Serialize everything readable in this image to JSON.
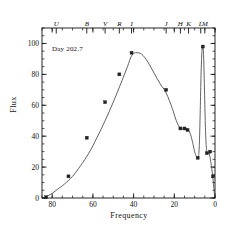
{
  "figure": {
    "annotation": "Day 202.7",
    "axis_color": "#111111",
    "curve_color": "#444444",
    "marker_color": "#222222"
  },
  "chart_data": {
    "type": "line",
    "title": "",
    "subtitle": "",
    "annotation": "Day 202.7",
    "xlabel": "Frequency",
    "ylabel": "Flux",
    "xlim": [
      85,
      0
    ],
    "ylim": [
      0,
      110
    ],
    "x_reversed": true,
    "grid": false,
    "legend": null,
    "xticks": [
      80,
      60,
      40,
      20,
      0
    ],
    "xtick_labels": [
      "80",
      "60",
      "40",
      "20",
      "0"
    ],
    "x_minor_tick_step": 5,
    "yticks": [
      0,
      20,
      40,
      60,
      80,
      100
    ],
    "ytick_labels": [
      "0",
      "20",
      "40",
      "60",
      "80",
      "100"
    ],
    "y_minor_tick_step": 5,
    "top_axis": {
      "label": "photometric bands",
      "bands": [
        {
          "name": "U",
          "x": 78
        },
        {
          "name": "B",
          "x": 63
        },
        {
          "name": "V",
          "x": 54
        },
        {
          "name": "R",
          "x": 47
        },
        {
          "name": "I",
          "x": 41
        },
        {
          "name": "J",
          "x": 24
        },
        {
          "name": "H",
          "x": 17
        },
        {
          "name": "K",
          "x": 13
        },
        {
          "name": "L",
          "x": 7
        },
        {
          "name": "M",
          "x": 5
        }
      ]
    },
    "series": [
      {
        "name": "model curve",
        "style": "solid",
        "x": [
          83.5,
          82,
          80,
          77,
          74,
          70,
          66,
          62,
          58,
          54,
          50,
          46,
          43,
          41,
          39,
          36,
          33,
          30,
          27,
          24,
          21,
          19,
          17,
          15,
          14,
          13,
          12,
          11,
          10,
          9.2,
          8.5,
          8.0,
          7.6,
          7.2,
          6.8,
          6.4,
          6.0,
          5.6,
          5.2,
          4.8,
          4.4,
          4.0,
          3.5,
          3.0,
          2.4,
          1.8,
          1.2,
          0.6,
          0.2
        ],
        "y": [
          0.5,
          1.5,
          3,
          6,
          9,
          14,
          21,
          29,
          39,
          50,
          62,
          75,
          85,
          92,
          94,
          93,
          88,
          81,
          74,
          68,
          58,
          50,
          45,
          45,
          45,
          44,
          41,
          36,
          30,
          27,
          26,
          28,
          38,
          60,
          82,
          95,
          98,
          92,
          72,
          50,
          36,
          30,
          29,
          29,
          26,
          21,
          15,
          7,
          1
        ]
      }
    ],
    "data_points": {
      "name": "observed photometry",
      "marker": "square",
      "x": [
        83,
        72,
        63,
        54,
        47,
        41,
        24,
        17,
        15,
        13.5,
        8.5,
        6.0,
        4.0,
        2.4,
        1.0
      ],
      "y": [
        0.5,
        14,
        39,
        62,
        80,
        94,
        70,
        45,
        45,
        44,
        26,
        98,
        29,
        30,
        14
      ]
    }
  }
}
